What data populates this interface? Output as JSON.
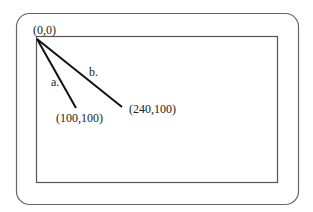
{
  "diagram": {
    "origin_label": "(0,0)",
    "lines": [
      {
        "name": "a",
        "label": "a.",
        "end_label": "(100,100)"
      },
      {
        "name": "b",
        "label": "b.",
        "end_label": "(240,100)"
      }
    ],
    "colors": {
      "frame": "#555555",
      "line": "#111111",
      "text": "#222222"
    }
  }
}
